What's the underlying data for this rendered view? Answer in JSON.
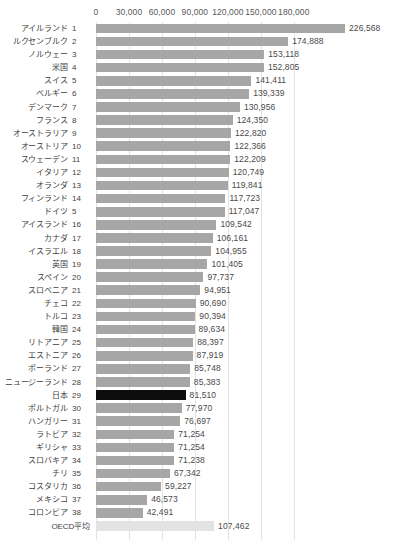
{
  "chart_data": {
    "type": "bar",
    "orientation": "horizontal",
    "title": "",
    "xlabel": "",
    "ylabel": "",
    "xlim": [
      0,
      195000
    ],
    "grid": true,
    "legend": null,
    "axis_ticks": [
      "0",
      "30,000",
      "60,000",
      "90,000",
      "120,000",
      "150,000",
      "180,000"
    ],
    "axis_tick_values": [
      0,
      30000,
      60000,
      90000,
      120000,
      150000,
      180000
    ],
    "highlight_color": "#0d0d0d",
    "bar_color": "#a6a6a6",
    "average_color": "#e3e3e3",
    "categories": [
      "アイルランド",
      "ルクセンブルク",
      "ノルウェー",
      "米国",
      "スイス",
      "ベルギー",
      "デンマーク",
      "フランス",
      "オーストラリア",
      "オーストリア",
      "スウェーデン",
      "イタリア",
      "オランダ",
      "フィンランド",
      "ドイツ",
      "アイスランド",
      "カナダ",
      "イスラエル",
      "英国",
      "スペイン",
      "スロベニア",
      "チェコ",
      "トルコ",
      "韓国",
      "リトアニア",
      "エストニア",
      "ポーランド",
      "ニュージーランド",
      "日本",
      "ポルトガル",
      "ハンガリー",
      "ラトビア",
      "ギリシャ",
      "スロバキア",
      "チリ",
      "コスタリカ",
      "メキシコ",
      "コロンビア",
      "OECD平均"
    ],
    "values": [
      226568,
      174888,
      153118,
      152805,
      141411,
      139339,
      130956,
      124350,
      122820,
      122366,
      122209,
      120749,
      119841,
      117723,
      117047,
      109542,
      106161,
      104955,
      101405,
      97737,
      94951,
      90690,
      90394,
      89634,
      88397,
      87919,
      85748,
      85383,
      81510,
      77970,
      76697,
      71254,
      71254,
      71238,
      67342,
      59227,
      46573,
      42491,
      107462
    ]
  },
  "rows": [
    {
      "name": "アイルランド",
      "rank": "1",
      "value": 226568,
      "value_label": "226,568",
      "style": "normal"
    },
    {
      "name": "ルクセンブルク",
      "rank": "2",
      "value": 174888,
      "value_label": "174,888",
      "style": "normal"
    },
    {
      "name": "ノルウェー",
      "rank": "3",
      "value": 153118,
      "value_label": "153,118",
      "style": "normal"
    },
    {
      "name": "米国",
      "rank": "4",
      "value": 152805,
      "value_label": "152,805",
      "style": "normal"
    },
    {
      "name": "スイス",
      "rank": "5",
      "value": 141411,
      "value_label": "141,411",
      "style": "normal"
    },
    {
      "name": "ベルギー",
      "rank": "6",
      "value": 139339,
      "value_label": "139,339",
      "style": "normal"
    },
    {
      "name": "デンマーク",
      "rank": "7",
      "value": 130956,
      "value_label": "130,956",
      "style": "normal"
    },
    {
      "name": "フランス",
      "rank": "8",
      "value": 124350,
      "value_label": "124,350",
      "style": "normal"
    },
    {
      "name": "オーストラリア",
      "rank": "9",
      "value": 122820,
      "value_label": "122,820",
      "style": "normal"
    },
    {
      "name": "オーストリア",
      "rank": "10",
      "value": 122366,
      "value_label": "122,366",
      "style": "normal"
    },
    {
      "name": "スウェーデン",
      "rank": "11",
      "value": 122209,
      "value_label": "122,209",
      "style": "normal"
    },
    {
      "name": "イタリア",
      "rank": "12",
      "value": 120749,
      "value_label": "120,749",
      "style": "normal"
    },
    {
      "name": "オランダ",
      "rank": "13",
      "value": 119841,
      "value_label": "119,841",
      "style": "normal"
    },
    {
      "name": "フィンランド",
      "rank": "14",
      "value": 117723,
      "value_label": "117,723",
      "style": "normal"
    },
    {
      "name": "ドイツ",
      "rank": "5",
      "value": 117047,
      "value_label": "117,047",
      "style": "normal"
    },
    {
      "name": "アイスランド",
      "rank": "16",
      "value": 109542,
      "value_label": "109,542",
      "style": "normal"
    },
    {
      "name": "カナダ",
      "rank": "17",
      "value": 106161,
      "value_label": "106,161",
      "style": "normal"
    },
    {
      "name": "イスラエル",
      "rank": "18",
      "value": 104955,
      "value_label": "104,955",
      "style": "normal"
    },
    {
      "name": "英国",
      "rank": "19",
      "value": 101405,
      "value_label": "101,405",
      "style": "normal"
    },
    {
      "name": "スペイン",
      "rank": "20",
      "value": 97737,
      "value_label": "97,737",
      "style": "normal"
    },
    {
      "name": "スロベニア",
      "rank": "21",
      "value": 94951,
      "value_label": "94,951",
      "style": "normal"
    },
    {
      "name": "チェコ",
      "rank": "22",
      "value": 90690,
      "value_label": "90,690",
      "style": "normal"
    },
    {
      "name": "トルコ",
      "rank": "23",
      "value": 90394,
      "value_label": "90,394",
      "style": "normal"
    },
    {
      "name": "韓国",
      "rank": "24",
      "value": 89634,
      "value_label": "89,634",
      "style": "normal"
    },
    {
      "name": "リトアニア",
      "rank": "25",
      "value": 88397,
      "value_label": "88,397",
      "style": "normal"
    },
    {
      "name": "エストニア",
      "rank": "26",
      "value": 87919,
      "value_label": "87,919",
      "style": "normal"
    },
    {
      "name": "ポーランド",
      "rank": "27",
      "value": 85748,
      "value_label": "85,748",
      "style": "normal"
    },
    {
      "name": "ニュージーランド",
      "rank": "28",
      "value": 85383,
      "value_label": "85,383",
      "style": "normal"
    },
    {
      "name": "日本",
      "rank": "29",
      "value": 81510,
      "value_label": "81,510",
      "style": "highlight"
    },
    {
      "name": "ポルトガル",
      "rank": "30",
      "value": 77970,
      "value_label": "77,970",
      "style": "normal"
    },
    {
      "name": "ハンガリー",
      "rank": "31",
      "value": 76697,
      "value_label": "76,697",
      "style": "normal"
    },
    {
      "name": "ラトビア",
      "rank": "32",
      "value": 71254,
      "value_label": "71,254",
      "style": "normal"
    },
    {
      "name": "ギリシャ",
      "rank": "33",
      "value": 71254,
      "value_label": "71,254",
      "style": "normal"
    },
    {
      "name": "スロバキア",
      "rank": "34",
      "value": 71238,
      "value_label": "71,238",
      "style": "normal"
    },
    {
      "name": "チリ",
      "rank": "35",
      "value": 67342,
      "value_label": "67,342",
      "style": "normal"
    },
    {
      "name": "コスタリカ",
      "rank": "36",
      "value": 59227,
      "value_label": "59,227",
      "style": "normal"
    },
    {
      "name": "メキシコ",
      "rank": "37",
      "value": 46573,
      "value_label": "46,573",
      "style": "normal"
    },
    {
      "name": "コロンビア",
      "rank": "38",
      "value": 42491,
      "value_label": "42,491",
      "style": "normal"
    },
    {
      "name": "OECD平均",
      "rank": "",
      "value": 107462,
      "value_label": "107,462",
      "style": "average"
    }
  ]
}
